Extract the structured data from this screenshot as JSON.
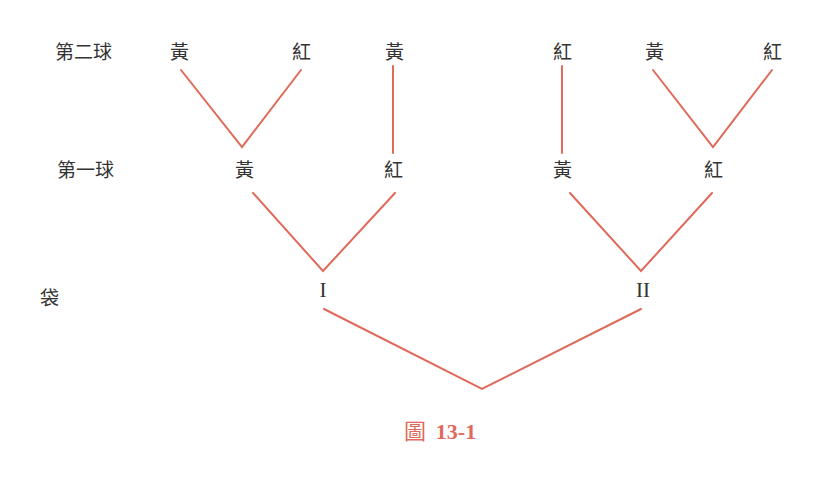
{
  "diagram": {
    "type": "tree",
    "line_color": "#e06a5a",
    "text_color": "#333333",
    "row_labels": {
      "second_ball": "第二球",
      "first_ball": "第一球",
      "bag": "袋"
    },
    "second_ball_nodes": [
      "黃",
      "紅",
      "黃",
      "紅",
      "黃",
      "紅"
    ],
    "first_ball_nodes": [
      "黃",
      "紅",
      "黃",
      "紅"
    ],
    "bag_nodes": [
      "I",
      "II"
    ],
    "caption": {
      "prefix": "圖",
      "number": "13-1"
    }
  }
}
